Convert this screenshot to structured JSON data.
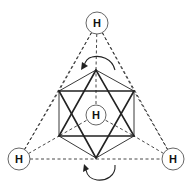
{
  "figure": {
    "colors": {
      "line": "#222222",
      "dashed": "#333333",
      "atom_border": "#555555",
      "background": "#ffffff"
    }
  },
  "atoms": [
    {
      "id": "top",
      "label": "H"
    },
    {
      "id": "center",
      "label": "H"
    },
    {
      "id": "bottom-left",
      "label": "H"
    },
    {
      "id": "bottom-right",
      "label": "H"
    }
  ],
  "arrows": [
    {
      "id": "top-rotation",
      "direction": "counterclockwise"
    },
    {
      "id": "bottom-rotation",
      "direction": "counterclockwise"
    }
  ]
}
